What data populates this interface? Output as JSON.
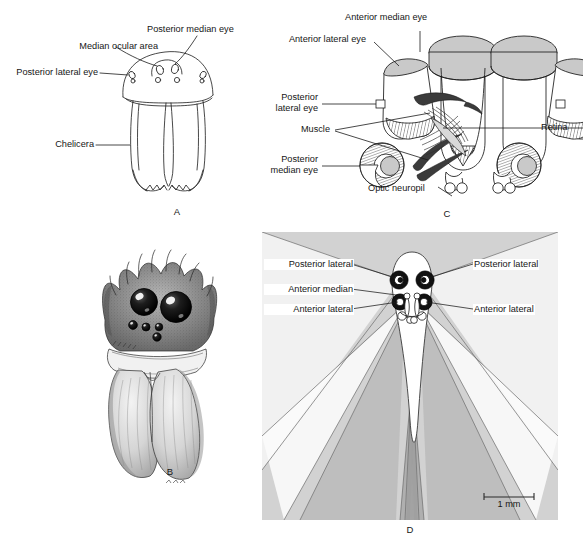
{
  "figure": {
    "type": "scientific-illustration",
    "panels": [
      "A",
      "B",
      "C",
      "D"
    ]
  },
  "panel_a": {
    "letter": "A",
    "caption": "Frontal view of carapace and chelicerae showing eye positions",
    "labels": [
      {
        "id": "median-ocular-area",
        "text": "Median ocular area"
      },
      {
        "id": "posterior-median-eye",
        "text": "Posterior median eye"
      },
      {
        "id": "posterior-lateral-eye",
        "text": "Posterior lateral eye"
      },
      {
        "id": "chelicera",
        "text": "Chelicera"
      }
    ]
  },
  "panel_b": {
    "letter": "B",
    "caption": "Stipple drawing of spider face with enlarged anterior median eyes"
  },
  "panel_c": {
    "letter": "C",
    "caption": "Cutaway of eye tubes, retinae, muscles and optic neuropils",
    "labels": [
      {
        "id": "anterior-median-eye",
        "text": "Anterior median eye"
      },
      {
        "id": "anterior-lateral-eye",
        "text": "Anterior lateral eye"
      },
      {
        "id": "posterior-lateral-eye",
        "text": "Posterior\nlateral eye"
      },
      {
        "id": "posterior-lateral-eye-l1",
        "text": "Posterior"
      },
      {
        "id": "posterior-lateral-eye-l2",
        "text": "lateral eye"
      },
      {
        "id": "muscle",
        "text": "Muscle"
      },
      {
        "id": "posterior-median-eye-l1",
        "text": "Posterior"
      },
      {
        "id": "posterior-median-eye-l2",
        "text": "median eye"
      },
      {
        "id": "optic-neuropil",
        "text": "Optic neuropil"
      },
      {
        "id": "retina",
        "text": "Retina"
      }
    ]
  },
  "panel_d": {
    "letter": "D",
    "caption": "Dorsal view of visual fields of the eyes",
    "labels": [
      {
        "id": "posterior-lateral-left",
        "text": "Posterior lateral"
      },
      {
        "id": "posterior-lateral-right",
        "text": "Posterior lateral"
      },
      {
        "id": "anterior-median",
        "text": "Anterior median"
      },
      {
        "id": "anterior-lateral-left",
        "text": "Anterior lateral"
      },
      {
        "id": "anterior-lateral-right",
        "text": "Anterior lateral"
      }
    ],
    "scale_bar": {
      "text": "1 mm",
      "value": 1,
      "unit": "mm"
    }
  },
  "colors": {
    "ink": "#1a1a1a",
    "panel_d_background": "#d2d2d2",
    "visual_field_light": "#ffffff",
    "visual_field_mid": "#c2c2c2",
    "visual_field_dark": "#b0b0b0",
    "lens_grey": "#c9c9c9",
    "eye_dark": "#111111"
  }
}
